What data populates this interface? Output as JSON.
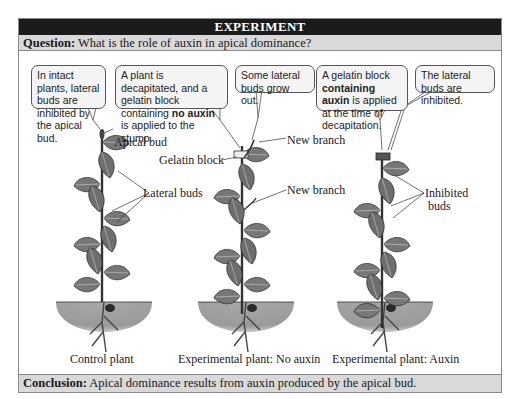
{
  "header": {
    "title": "EXPERIMENT"
  },
  "question": {
    "label": "Question:",
    "text": " What is the role of auxin in apical dominance?"
  },
  "bubbles": [
    {
      "text": "In intact plants, lateral buds are inhibited by the apical bud."
    },
    {
      "pre": "A plant is decapitated, and a gelatin block containing ",
      "bold": "no auxin",
      "post": " is applied to the stump."
    },
    {
      "text": "Some lateral buds grow out."
    },
    {
      "pre": "A gelatin block ",
      "bold": "containing auxin",
      "post": " is applied at the time of decapitation."
    },
    {
      "text": "The lateral buds are inhibited."
    }
  ],
  "labels": {
    "apical_bud": "Apical bud",
    "lateral_buds": "Lateral buds",
    "gelatin_block": "Gelatin block",
    "new_branch_1": "New branch",
    "new_branch_2": "New branch",
    "inhibited_buds_1": "Inhibited",
    "inhibited_buds_2": "buds"
  },
  "captions": {
    "control": "Control plant",
    "no_auxin": "Experimental plant: No auxin",
    "auxin": "Experimental plant: Auxin"
  },
  "conclusion": {
    "label": "Conclusion:",
    "text": " Apical dominance results from auxin produced by the apical bud."
  },
  "colors": {
    "header_bg": "#1b1b1b",
    "bar_bg": "#d9d9d9",
    "soil": "#9d9d9d",
    "leaf": "#7a7a7a"
  }
}
